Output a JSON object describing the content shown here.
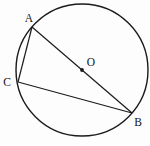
{
  "figure": {
    "background_color": "#fdfdfd",
    "stroke_color": "#1b1b1b",
    "label_color": "#141414",
    "circle": {
      "cx": 82,
      "cy": 70,
      "r": 66
    },
    "center_dot": {
      "cx": 82,
      "cy": 70,
      "r": 1.9
    },
    "points": {
      "A": {
        "x": 32,
        "y": 27
      },
      "B": {
        "x": 132,
        "y": 113
      },
      "C": {
        "x": 18,
        "y": 82
      },
      "O": {
        "x": 82,
        "y": 70
      }
    },
    "chords": [
      {
        "name": "chord-AB-diameter",
        "x1": 32,
        "y1": 27,
        "x2": 132,
        "y2": 113
      },
      {
        "name": "chord-AC",
        "x1": 32,
        "y1": 27,
        "x2": 18,
        "y2": 82
      },
      {
        "name": "chord-CB",
        "x1": 18,
        "y1": 82,
        "x2": 132,
        "y2": 113
      }
    ],
    "labels": [
      {
        "name": "point-label-A",
        "text": "A",
        "x": 29,
        "y": 22,
        "anchor": "middle"
      },
      {
        "name": "point-label-O",
        "text": "O",
        "x": 91,
        "y": 66,
        "anchor": "middle"
      },
      {
        "name": "point-label-C",
        "text": "C",
        "x": 7,
        "y": 86,
        "anchor": "middle"
      },
      {
        "name": "point-label-B",
        "text": "B",
        "x": 138,
        "y": 126,
        "anchor": "middle"
      }
    ]
  }
}
